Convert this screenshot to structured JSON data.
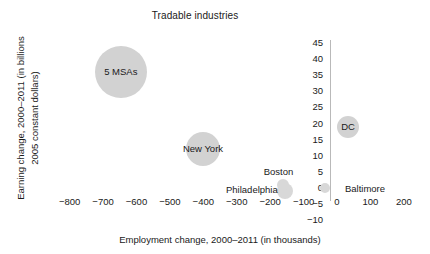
{
  "chart_data": {
    "type": "scatter",
    "title": "Tradable industries",
    "xlabel": "Employment change, 2000–2011 (in thousands)",
    "ylabel_line1": "Earning change, 2000–2011 (in billions",
    "ylabel_line2": "2005 constant dollars)",
    "xlim": [
      -850,
      230
    ],
    "ylim": [
      -10,
      47
    ],
    "grid": false,
    "legend": "none",
    "xticks": [
      "−800",
      "−700",
      "−600",
      "−500",
      "−400",
      "−300",
      "−200",
      "−100",
      "0",
      "100",
      "200"
    ],
    "xtick_values": [
      -800,
      -700,
      -600,
      -500,
      -400,
      -300,
      -200,
      -100,
      0,
      100,
      200
    ],
    "yticks": [
      "45",
      "40",
      "35",
      "30",
      "25",
      "20",
      "15",
      "10",
      "5",
      "0",
      "−5",
      "−10"
    ],
    "ytick_values": [
      45,
      40,
      35,
      30,
      25,
      20,
      15,
      10,
      5,
      0,
      -5,
      -10
    ],
    "points": [
      {
        "label": "5 MSAs",
        "x": -647,
        "y": 36,
        "size": 26,
        "label_dx": 0,
        "label_dy": 0,
        "faint": false
      },
      {
        "label": "New York",
        "x": -401,
        "y": 12,
        "size": 17,
        "label_dx": 0,
        "label_dy": 0,
        "faint": false
      },
      {
        "label": "DC",
        "x": 33,
        "y": 19,
        "size": 11,
        "label_dx": 0,
        "label_dy": 0,
        "faint": false
      },
      {
        "label": "Philadelphia",
        "x": -156,
        "y": -1,
        "size": 8,
        "label_dx": -33,
        "label_dy": -1,
        "faint": true
      },
      {
        "label": "Boston",
        "x": -163,
        "y": 1,
        "size": 6,
        "label_dx": -4,
        "label_dy": -13,
        "faint": true
      },
      {
        "label": "Baltimore",
        "x": -36,
        "y": 0,
        "size": 5,
        "label_dx": 40,
        "label_dy": 1,
        "faint": true
      }
    ]
  }
}
